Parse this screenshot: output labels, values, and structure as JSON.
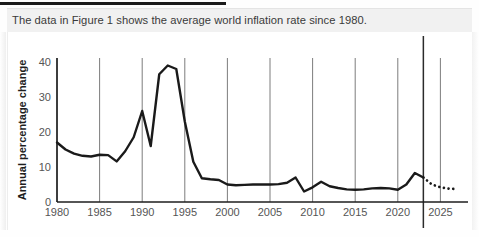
{
  "stem": {
    "text": "The data in Figure 1 shows the average world inflation rate since 1980."
  },
  "colors": {
    "panel_bg": "#f1f1f1",
    "stem_text": "#3a3a3a",
    "line": "#1a1a1a",
    "gridline": "#6e6e6e",
    "marker_line": "#2b2b2b",
    "axis": "#1e1e1e",
    "tick_text": "#555555",
    "top_rule": "#1b1b1b"
  },
  "chart_data": {
    "type": "line",
    "title": "",
    "xlabel": "",
    "ylabel": "Annual percentage change",
    "xlim": [
      1980,
      2027
    ],
    "ylim": [
      0,
      40
    ],
    "yticks": [
      0,
      10,
      20,
      30,
      40
    ],
    "ytick_labels": [
      "0",
      "10",
      "20",
      "30",
      "40"
    ],
    "xticks": [
      1980,
      1985,
      1990,
      1995,
      2000,
      2005,
      2010,
      2015,
      2020,
      2025
    ],
    "xtick_labels": [
      "1980",
      "1985",
      "1990",
      "1995",
      "2000",
      "2005",
      "2010",
      "2015",
      "2020",
      "2025"
    ],
    "grid": "vertical-only",
    "legend": "none",
    "annotations": [
      {
        "name": "forecast-divider",
        "type": "vline",
        "x": 2023,
        "label": ""
      }
    ],
    "series": [
      {
        "name": "World inflation rate (actual)",
        "style": "solid",
        "x": [
          1980,
          1981,
          1982,
          1983,
          1984,
          1985,
          1986,
          1987,
          1988,
          1989,
          1990,
          1991,
          1992,
          1993,
          1994,
          1995,
          1996,
          1997,
          1998,
          1999,
          2000,
          2001,
          2002,
          2003,
          2004,
          2005,
          2006,
          2007,
          2008,
          2009,
          2010,
          2011,
          2012,
          2013,
          2014,
          2015,
          2016,
          2017,
          2018,
          2019,
          2020,
          2021,
          2022,
          2023
        ],
        "values": [
          17.0,
          15.0,
          13.8,
          13.2,
          13.0,
          13.5,
          13.4,
          11.6,
          14.5,
          18.5,
          26.0,
          16.0,
          36.5,
          39.0,
          38.0,
          23.0,
          11.5,
          6.8,
          6.5,
          6.3,
          5.0,
          4.8,
          4.9,
          5.0,
          5.0,
          5.0,
          5.1,
          5.5,
          7.0,
          3.0,
          4.2,
          5.8,
          4.5,
          4.0,
          3.6,
          3.5,
          3.6,
          3.9,
          4.0,
          3.9,
          3.5,
          5.0,
          8.3,
          7.0
        ]
      },
      {
        "name": "World inflation rate (forecast)",
        "style": "dotted",
        "x": [
          2023,
          2024,
          2025,
          2026,
          2027
        ],
        "values": [
          7.0,
          5.0,
          4.2,
          3.8,
          3.7
        ]
      }
    ]
  }
}
